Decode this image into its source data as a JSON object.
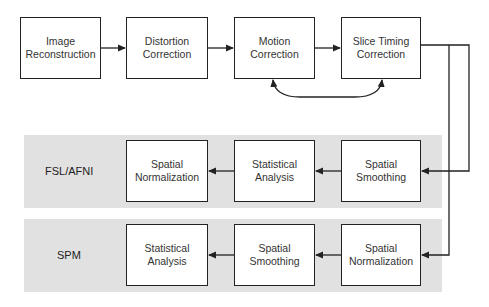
{
  "colors": {
    "band": "#e1e1e1",
    "stroke": "#222222",
    "text": "#333333"
  },
  "top_row": [
    {
      "id": "image-reconstruction",
      "label_line1": "Image",
      "label_line2": "Reconstruction"
    },
    {
      "id": "distortion-correction",
      "label_line1": "Distortion",
      "label_line2": "Correction"
    },
    {
      "id": "motion-correction",
      "label_line1": "Motion",
      "label_line2": "Correction"
    },
    {
      "id": "slice-timing-correction",
      "label_line1": "Slice Timing",
      "label_line2": "Correction"
    }
  ],
  "pipelines": [
    {
      "name": "FSL/AFNI",
      "steps": [
        {
          "label_line1": "Spatial",
          "label_line2": "Smoothing"
        },
        {
          "label_line1": "Statistical",
          "label_line2": "Analysis"
        },
        {
          "label_line1": "Spatial",
          "label_line2": "Normalization"
        }
      ]
    },
    {
      "name": "SPM",
      "steps": [
        {
          "label_line1": "Spatial",
          "label_line2": "Normalization"
        },
        {
          "label_line1": "Spatial",
          "label_line2": "Smoothing"
        },
        {
          "label_line1": "Statistical",
          "label_line2": "Analysis"
        }
      ]
    }
  ],
  "edges": [
    {
      "from": "Image Reconstruction",
      "to": "Distortion Correction"
    },
    {
      "from": "Distortion Correction",
      "to": "Motion Correction"
    },
    {
      "from": "Motion Correction",
      "to": "Slice Timing Correction"
    },
    {
      "from": "Motion Correction",
      "to": "Slice Timing Correction",
      "bidirectional": true,
      "style": "curved"
    },
    {
      "from": "Slice Timing Correction",
      "to": "FSL/AFNI: Spatial Smoothing"
    },
    {
      "from": "Slice Timing Correction",
      "to": "SPM: Spatial Normalization"
    }
  ]
}
